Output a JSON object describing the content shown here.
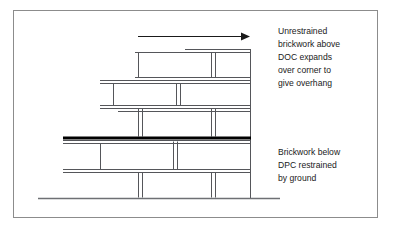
{
  "figure": {
    "border_color": "#8c8c8c",
    "line_color": "#55565a",
    "dpc_color": "#000000",
    "ground_color": "#6e7074",
    "text_color": "#1a1a1a",
    "background": "#ffffff"
  },
  "annotations": {
    "upper": {
      "name": "unrestrained-brickwork-note",
      "lines": [
        "Unrestrained",
        "brickwork above",
        "DOC expands",
        "over corner to",
        "give overhang"
      ]
    },
    "lower": {
      "name": "restrained-brickwork-note",
      "lines": [
        "Brickwork below",
        "DPC restrained",
        "by ground"
      ]
    }
  },
  "arrow": {
    "name": "expansion-direction-arrow",
    "label": "expansion direction",
    "direction": "right"
  },
  "elements": {
    "dpc_line_label": "DPC (damp proof course)",
    "ground_line_label": "ground line",
    "upper_wall_label": "unrestrained brickwork above DPC",
    "lower_wall_label": "restrained brickwork below DPC"
  }
}
